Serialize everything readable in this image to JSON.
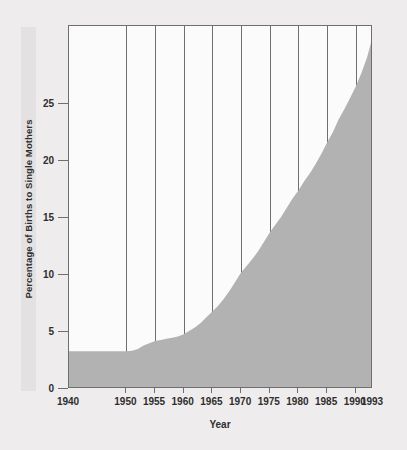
{
  "chart_data": {
    "type": "area",
    "title": "",
    "xlabel": "Year",
    "ylabel": "Percentage of Births to Single Mothers",
    "xlim": [
      1940,
      1993
    ],
    "ylim": [
      0,
      31.8
    ],
    "grid": true,
    "grid_axis": "x",
    "legend": "none",
    "xticks": [
      1940,
      1950,
      1955,
      1960,
      1965,
      1970,
      1975,
      1980,
      1985,
      1990,
      1993
    ],
    "xticklabels": [
      "1940",
      "1950",
      "1955",
      "1960",
      "1965",
      "1970",
      "1975",
      "1980",
      "1985",
      "1990",
      "1993"
    ],
    "yticks": [
      0,
      5,
      10,
      15,
      20,
      25
    ],
    "yticklabels": [
      "0",
      "5",
      "10",
      "15",
      "20",
      "25"
    ],
    "area_color": "#b2b2b2",
    "plot_bg": "#fbfbfb",
    "figure_bg": "#eeecec",
    "axis_color": "#6f6f6f",
    "x": [
      1940,
      1941,
      1942,
      1943,
      1944,
      1945,
      1946,
      1947,
      1948,
      1949,
      1950,
      1951,
      1952,
      1953,
      1954,
      1955,
      1956,
      1957,
      1958,
      1959,
      1960,
      1961,
      1962,
      1963,
      1964,
      1965,
      1966,
      1967,
      1968,
      1969,
      1970,
      1971,
      1972,
      1973,
      1974,
      1975,
      1976,
      1977,
      1978,
      1979,
      1980,
      1981,
      1982,
      1983,
      1984,
      1985,
      1986,
      1987,
      1988,
      1989,
      1990,
      1991,
      1992,
      1993
    ],
    "values": [
      3.3,
      3.3,
      3.3,
      3.3,
      3.3,
      3.3,
      3.3,
      3.3,
      3.3,
      3.3,
      3.3,
      3.35,
      3.5,
      3.8,
      4.0,
      4.2,
      4.3,
      4.4,
      4.5,
      4.6,
      4.8,
      5.1,
      5.4,
      5.8,
      6.3,
      6.8,
      7.3,
      7.9,
      8.6,
      9.4,
      10.2,
      10.8,
      11.4,
      12.1,
      12.9,
      13.7,
      14.4,
      15.1,
      15.9,
      16.7,
      17.4,
      18.2,
      18.9,
      19.7,
      20.6,
      21.6,
      22.5,
      23.6,
      24.5,
      25.5,
      26.5,
      27.7,
      29.1,
      31.0
    ],
    "annotations": []
  },
  "axis": {
    "xlabel_text": "Year",
    "ylabel_text": "Percentage of Births to Single Mothers"
  }
}
